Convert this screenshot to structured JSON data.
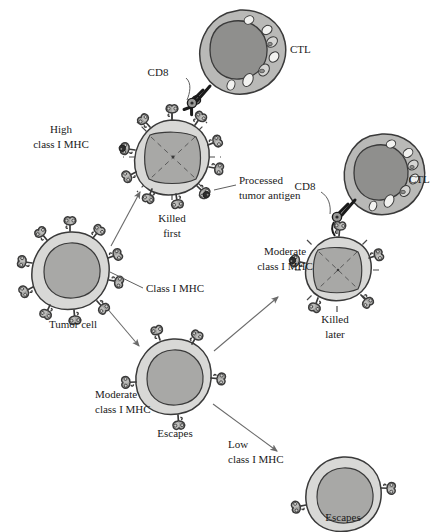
{
  "diagram": {
    "background_color": "#ffffff",
    "colors": {
      "cell_membrane": "#d8d8d6",
      "cell_nucleus": "#a8a8a6",
      "ctl_cytoplasm": "#b9b9b7",
      "ctl_nucleus": "#8f8f8d",
      "granule": "#f2f2f0",
      "receptor": "#a6a6a4",
      "outline": "#3a3a3a",
      "antigen_dot": "#2e2e2e",
      "arrow": "#6a6a6a"
    },
    "labels": {
      "cd8_top": "CD8",
      "ctl_top": "CTL",
      "high_class_i_mhc_line1": "High",
      "high_class_i_mhc_line2": "class I MHC",
      "processed_antigen_line1": "Processed",
      "processed_antigen_line2": "tumor antigen",
      "killed_first_line1": "Killed",
      "killed_first_line2": "first",
      "cd8_right": "CD8",
      "ctl_right": "CTL",
      "moderate_right_line1": "Moderate",
      "moderate_right_line2": "class I MHC",
      "killed_later_line1": "Killed",
      "killed_later_line2": "later",
      "class_i_mhc": "Class I MHC",
      "tumor_cell": "Tumor cell",
      "moderate_middle_line1": "Moderate",
      "moderate_middle_line2": "class I MHC",
      "escapes_middle": "Escapes",
      "low_class_i_mhc_line1": "Low",
      "low_class_i_mhc_line2": "class I MHC",
      "escapes_bottom": "Escapes"
    },
    "cells": [
      {
        "id": "tumor-cell",
        "name": "Tumor cell",
        "type": "tumor",
        "state": "parent",
        "mhc_level": "normal",
        "receptor_count": 10,
        "cx": 70,
        "cy": 270,
        "r": 38
      },
      {
        "id": "killed-first-cell",
        "name": "Killed first",
        "type": "tumor",
        "state": "killed",
        "mhc_level": "high",
        "receptor_count": 10,
        "antigen_count": 2,
        "cx": 172,
        "cy": 157,
        "r": 37
      },
      {
        "id": "killed-later-cell",
        "name": "Killed later",
        "type": "tumor",
        "state": "killed",
        "mhc_level": "moderate",
        "receptor_count": 5,
        "antigen_count": 1,
        "cx": 337,
        "cy": 270,
        "r": 34
      },
      {
        "id": "escaping-moderate-cell",
        "name": "Escapes (moderate)",
        "type": "tumor",
        "state": "escaped",
        "mhc_level": "moderate",
        "receptor_count": 5,
        "cx": 173,
        "cy": 375,
        "r": 36
      },
      {
        "id": "escaping-low-cell",
        "name": "Escapes (low)",
        "type": "tumor",
        "state": "escaped",
        "mhc_level": "low",
        "receptor_count": 2,
        "cx": 343,
        "cy": 492,
        "r": 35
      },
      {
        "id": "ctl-top",
        "name": "CTL",
        "type": "ctl",
        "granule_count": 7,
        "cx": 240,
        "cy": 52,
        "r": 42
      },
      {
        "id": "ctl-right",
        "name": "CTL",
        "type": "ctl",
        "granule_count": 7,
        "cx": 382,
        "cy": 175,
        "r": 40
      }
    ],
    "arrows": [
      {
        "id": "arrow-tumor-to-killed-first",
        "from": "tumor-cell",
        "to": "killed-first-cell"
      },
      {
        "id": "arrow-tumor-to-escaping-moderate",
        "from": "tumor-cell",
        "to": "escaping-moderate-cell"
      },
      {
        "id": "arrow-moderate-to-killed-later",
        "from": "escaping-moderate-cell",
        "to": "killed-later-cell"
      },
      {
        "id": "arrow-moderate-to-escaping-low",
        "from": "escaping-moderate-cell",
        "to": "escaping-low-cell"
      }
    ]
  }
}
